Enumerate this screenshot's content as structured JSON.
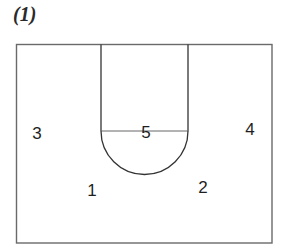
{
  "title": "(1)",
  "court": {
    "boundary": {
      "x": 16,
      "y": 44,
      "width": 256,
      "height": 199
    },
    "lane": {
      "left_x": 101,
      "right_x": 188,
      "top_y": 44,
      "free_throw_y": 131
    },
    "free_throw_circle": {
      "cx": 144.5,
      "cy": 131,
      "r": 43.5,
      "half": "lower"
    },
    "line_color": "#333333"
  },
  "positions": [
    {
      "label": "1",
      "x": 92,
      "y": 190
    },
    {
      "label": "2",
      "x": 203,
      "y": 187
    },
    {
      "label": "3",
      "x": 37,
      "y": 133
    },
    {
      "label": "4",
      "x": 250,
      "y": 129
    },
    {
      "label": "5",
      "x": 146,
      "y": 132
    }
  ]
}
